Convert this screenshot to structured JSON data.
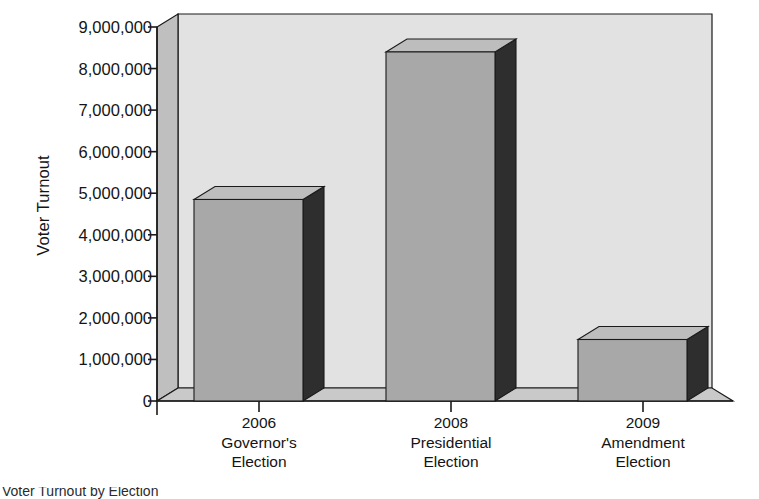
{
  "chart_data": {
    "type": "bar",
    "title": "",
    "xlabel": "",
    "ylabel": "Voter Turnout",
    "categories": [
      "2006 Governor's Election",
      "2008 Presidential Election",
      "2009 Amendment Election"
    ],
    "category_lines": [
      [
        "2006",
        "Governor's",
        "Election"
      ],
      [
        "2008",
        "Presidential",
        "Election"
      ],
      [
        "2009",
        "Amendment",
        "Election"
      ]
    ],
    "values": [
      4850000,
      8400000,
      1480000
    ],
    "ylim": [
      0,
      9000000
    ],
    "ytick_values": [
      0,
      1000000,
      2000000,
      3000000,
      4000000,
      5000000,
      6000000,
      7000000,
      8000000,
      9000000
    ],
    "ytick_labels": [
      "0",
      "1,000,000",
      "2,000,000",
      "3,000,000",
      "4,000,000",
      "5,000,000",
      "6,000,000",
      "7,000,000",
      "8,000,000",
      "9,000,000"
    ],
    "grid": false,
    "legend": "none",
    "style": "3d-bar",
    "colors": {
      "bar_front": "#a8a8a8",
      "bar_side": "#2e2e2e",
      "bar_top": "#bdbdbd",
      "back_wall": "#e2e2e2",
      "left_wall": "#bfbfbf",
      "floor": "#c9c9c9",
      "axis_line": "#1a1a1a",
      "text": "#141414",
      "page_background": "#ffffff"
    }
  },
  "caption": {
    "text": "Voter Turnout by Election"
  }
}
